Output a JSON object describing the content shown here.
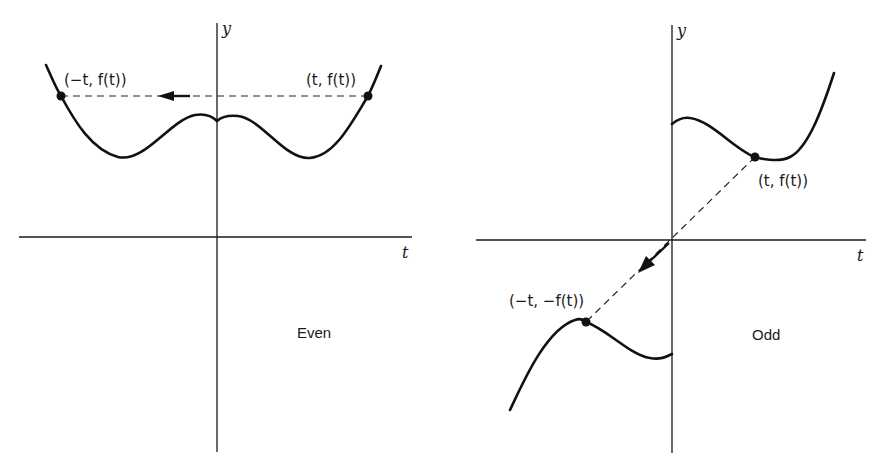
{
  "figure": {
    "panels": [
      {
        "id": "even",
        "caption": "Even",
        "axis_labels": {
          "x": "t",
          "y": "y"
        },
        "points": [
          {
            "label": "(−t, f(t))",
            "role": "reflected"
          },
          {
            "label": "(t, f(t))",
            "role": "original"
          }
        ],
        "description": "Even function: reflection across the y-axis, point (t, f(t)) maps to (−t, f(t))"
      },
      {
        "id": "odd",
        "caption": "Odd",
        "axis_labels": {
          "x": "t",
          "y": "y"
        },
        "points": [
          {
            "label": "(t, f(t))",
            "role": "original"
          },
          {
            "label": "(−t, −f(t))",
            "role": "reflected"
          }
        ],
        "description": "Odd function: reflection through the origin, point (t, f(t)) maps to (−t, −f(t))"
      }
    ],
    "colors": {
      "ink": "#111111",
      "background": "#ffffff"
    }
  }
}
